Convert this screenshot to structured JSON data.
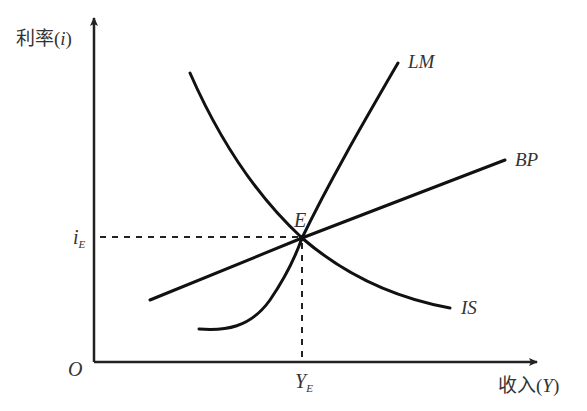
{
  "diagram": {
    "y_axis_label": "利率(i)",
    "y_axis_label_prefix": "利率(",
    "y_axis_label_var": "i",
    "y_axis_label_suffix": ")",
    "x_axis_label_prefix": "收入(",
    "x_axis_label_var": "Y",
    "x_axis_label_suffix": ")",
    "origin_label": "O",
    "equilibrium_point_label": "E",
    "equilibrium_rate_label": "i",
    "equilibrium_rate_sub": "E",
    "equilibrium_income_label": "Y",
    "equilibrium_income_sub": "E",
    "curves": [
      {
        "name": "IS",
        "label": "IS",
        "slope": "downward"
      },
      {
        "name": "LM",
        "label": "LM",
        "slope": "upward-steep"
      },
      {
        "name": "BP",
        "label": "BP",
        "slope": "upward-flat"
      }
    ],
    "colors": {
      "line": "#111111",
      "text": "#333333",
      "background": "#ffffff"
    }
  }
}
